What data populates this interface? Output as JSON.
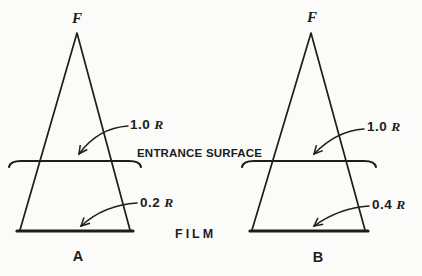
{
  "figure": {
    "colors": {
      "background": "#fbfbf9",
      "ink": "#1d1d1b"
    },
    "entrance_surface_label": "ENTRANCE SURFACE",
    "film_label": "FILM",
    "panels": [
      {
        "caption": "A",
        "focus_label": "F",
        "entrance_dose_value": "1.0",
        "entrance_dose_unit": "R",
        "film_dose_value": "0.2",
        "film_dose_unit": "R"
      },
      {
        "caption": "B",
        "focus_label": "F",
        "entrance_dose_value": "1.0",
        "entrance_dose_unit": "R",
        "film_dose_value": "0.4",
        "film_dose_unit": "R"
      }
    ]
  }
}
